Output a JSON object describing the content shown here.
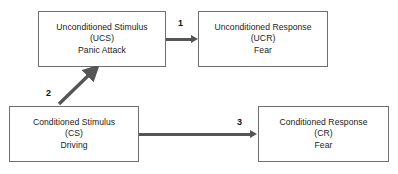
{
  "diagram": {
    "background_color": "#ffffff",
    "box_border_color": "#6e6e6e",
    "arrow_color": "#555555",
    "boxes": [
      {
        "id": "ucs",
        "name": "unconditioned-stimulus",
        "line1": "Unconditioned Stimulus",
        "line2": "(UCS)",
        "line3": "Panic Attack"
      },
      {
        "id": "ucr",
        "name": "unconditioned-response",
        "line1": "Unconditioned Response",
        "line2": "(UCR)",
        "line3": "Fear"
      },
      {
        "id": "cs",
        "name": "conditioned-stimulus",
        "line1": "Conditioned Stimulus",
        "line2": "(CS)",
        "line3": "Driving"
      },
      {
        "id": "cr",
        "name": "conditioned-response",
        "line1": "Conditioned Response",
        "line2": "(CR)",
        "line3": "Fear"
      }
    ],
    "arrows": [
      {
        "id": "a1",
        "label": "1",
        "from": "ucs",
        "to": "ucr",
        "direction": "horizontal-right"
      },
      {
        "id": "a2",
        "label": "2",
        "from": "cs",
        "to": "ucs",
        "direction": "diagonal-up-right"
      },
      {
        "id": "a3",
        "label": "3",
        "from": "cs",
        "to": "cr",
        "direction": "horizontal-right"
      }
    ]
  }
}
